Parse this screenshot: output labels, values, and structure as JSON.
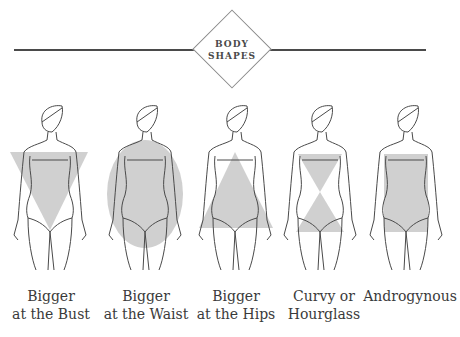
{
  "header": {
    "title_line1": "BODY",
    "title_line2": "SHAPES"
  },
  "figures": [
    {
      "shape": "inverted-triangle",
      "caption_line1": "Bigger",
      "caption_line2": "at the Bust"
    },
    {
      "shape": "oval",
      "caption_line1": "Bigger",
      "caption_line2": "at the Waist"
    },
    {
      "shape": "triangle",
      "caption_line1": "Bigger",
      "caption_line2": "at the Hips"
    },
    {
      "shape": "hourglass",
      "caption_line1": "Curvy or",
      "caption_line2": "Hourglass"
    },
    {
      "shape": "rectangle",
      "caption_line1": "Androgynous",
      "caption_line2": ""
    }
  ],
  "colors": {
    "shape_fill": "#c8c8c8",
    "line": "#4a4a4a",
    "text": "#3a3a3a"
  }
}
